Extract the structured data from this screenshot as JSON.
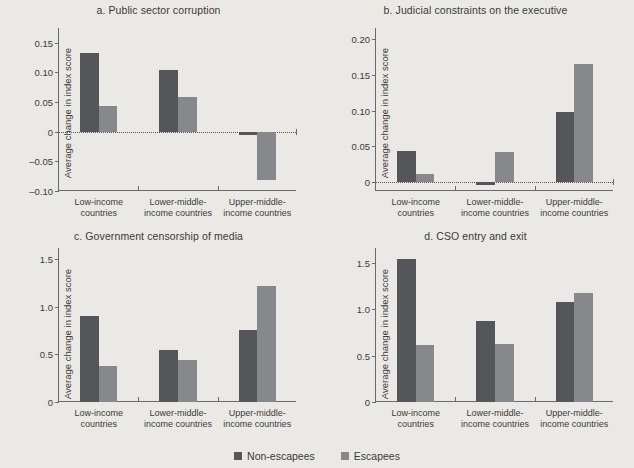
{
  "figure": {
    "background_color": "#ebe9e6",
    "series_colors": {
      "non_escapees": "#55565a",
      "escapees": "#86888b"
    },
    "ylabel": "Average change in index score",
    "categories": [
      "Low-income\ncountries",
      "Lower-middle-\nincome countries",
      "Upper-middle-\nincome countries"
    ],
    "category_lines": [
      [
        "Low-income",
        "countries"
      ],
      [
        "Lower-middle-",
        "income countries"
      ],
      [
        "Upper-middle-",
        "income countries"
      ]
    ],
    "legend": {
      "position": "bottom-center",
      "items": [
        {
          "label": "Non-escapees",
          "color": "#55565a"
        },
        {
          "label": "Escapees",
          "color": "#86888b"
        }
      ]
    }
  },
  "chart_data": [
    {
      "id": "a",
      "type": "bar",
      "title": "a. Public sector corruption",
      "xlabel": "",
      "ylabel": "Average change in index score",
      "categories": [
        "Low-income countries",
        "Lower-middle-income countries",
        "Upper-middle-income countries"
      ],
      "series": [
        {
          "name": "Non-escapees",
          "values": [
            0.133,
            0.104,
            -0.005
          ]
        },
        {
          "name": "Escapees",
          "values": [
            0.043,
            0.059,
            -0.081
          ]
        }
      ],
      "ylim": [
        -0.1,
        0.175
      ],
      "yticks": [
        0.15,
        0.1,
        0.05,
        0,
        -0.05,
        -0.1
      ],
      "ytick_labels": [
        "0.15",
        "0.10",
        "0.05",
        "0",
        "–0.05",
        "–0.10"
      ],
      "grid": false,
      "zero_line": true
    },
    {
      "id": "b",
      "type": "bar",
      "title": "b. Judicial constraints on the executive",
      "xlabel": "",
      "ylabel": "Average change in index score",
      "categories": [
        "Low-income countries",
        "Lower-middle-income countries",
        "Upper-middle-income countries"
      ],
      "series": [
        {
          "name": "Non-escapees",
          "values": [
            0.044,
            -0.004,
            0.098
          ]
        },
        {
          "name": "Escapees",
          "values": [
            0.012,
            0.042,
            0.165
          ]
        }
      ],
      "ylim": [
        -0.012,
        0.215
      ],
      "yticks": [
        0.2,
        0.15,
        0.1,
        0.05,
        0
      ],
      "ytick_labels": [
        "0.20",
        "0.15",
        "0.10",
        "0.05",
        "0"
      ],
      "grid": false,
      "zero_line": true
    },
    {
      "id": "c",
      "type": "bar",
      "title": "c. Government censorship of media",
      "xlabel": "",
      "ylabel": "Average change in index score",
      "categories": [
        "Low-income countries",
        "Lower-middle-income countries",
        "Upper-middle-income countries"
      ],
      "series": [
        {
          "name": "Non-escapees",
          "values": [
            0.9,
            0.55,
            0.76
          ]
        },
        {
          "name": "Escapees",
          "values": [
            0.38,
            0.44,
            1.22
          ]
        }
      ],
      "ylim": [
        0,
        1.62
      ],
      "yticks": [
        1.5,
        1.0,
        0.5,
        0
      ],
      "ytick_labels": [
        "1.5",
        "1.0",
        "0.5",
        "0"
      ],
      "grid": false,
      "zero_line": false
    },
    {
      "id": "d",
      "type": "bar",
      "title": "d. CSO entry and exit",
      "xlabel": "",
      "ylabel": "Average change in index score",
      "categories": [
        "Low-income countries",
        "Lower-middle-income countries",
        "Upper-middle-income countries"
      ],
      "series": [
        {
          "name": "Non-escapees",
          "values": [
            1.54,
            0.87,
            1.08
          ]
        },
        {
          "name": "Escapees",
          "values": [
            0.61,
            0.63,
            1.18
          ]
        }
      ],
      "ylim": [
        0,
        1.66
      ],
      "yticks": [
        1.5,
        1.0,
        0.5,
        0
      ],
      "ytick_labels": [
        "1.5",
        "1.0",
        "0.5",
        "0"
      ],
      "grid": false,
      "zero_line": false
    }
  ]
}
